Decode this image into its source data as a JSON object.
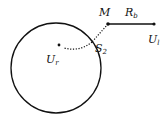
{
  "diagram": {
    "labels": {
      "M": "M",
      "R_base": "R",
      "R_sub": "b",
      "S_base": "S",
      "S_sub": "2",
      "Ul_base": "U",
      "Ul_sub": "l",
      "Ur_base": "U",
      "Ur_sub": "r"
    },
    "colors": {
      "stroke": "#111111",
      "background": "#ffffff"
    }
  }
}
